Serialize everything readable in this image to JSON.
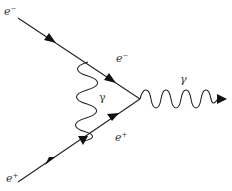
{
  "diagram": {
    "type": "feynman",
    "colors": {
      "line": "#222222",
      "text": "#333333",
      "background": "#ffffff"
    },
    "labels": {
      "electron_in": {
        "base": "e",
        "sup": "−"
      },
      "positron_in": {
        "base": "e",
        "sup": "+"
      },
      "electron_internal": {
        "base": "e",
        "sup": "−"
      },
      "positron_internal": {
        "base": "e",
        "sup": "+"
      },
      "photon_internal": "γ",
      "photon_out": "γ"
    },
    "particles": [
      {
        "name": "incoming electron",
        "from": [
          18,
          18
        ],
        "to": [
          140,
          99
        ]
      },
      {
        "name": "incoming positron",
        "from": [
          18,
          182
        ],
        "to": [
          140,
          99
        ]
      },
      {
        "name": "exchanged photon",
        "from": [
          88,
          61
        ],
        "to": [
          83,
          142
        ]
      },
      {
        "name": "outgoing photon",
        "from": [
          140,
          99
        ],
        "to": [
          226,
          99
        ]
      }
    ]
  }
}
